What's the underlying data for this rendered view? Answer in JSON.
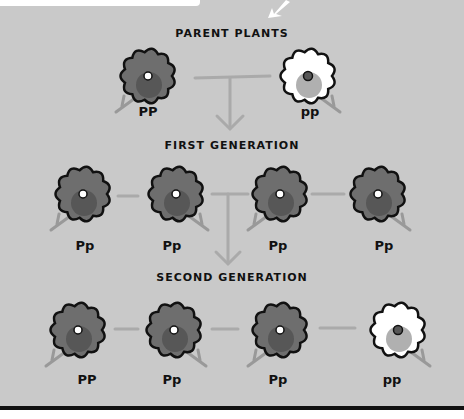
{
  "colors": {
    "background": "#c9c9c9",
    "purple_fill": "#6e6e6e",
    "purple_inner": "#575757",
    "white_fill": "#ffffff",
    "white_inner": "#b0b0b0",
    "line": "#aaaaaa",
    "outline": "#111111"
  },
  "headings": {
    "parents": "PARENT PLANTS",
    "first": "FIRST GENERATION",
    "second": "SECOND GENERATION"
  },
  "parents": [
    {
      "genotype": "PP",
      "color": "purple"
    },
    {
      "genotype": "pp",
      "color": "white"
    }
  ],
  "first_generation": [
    {
      "genotype": "Pp",
      "color": "purple"
    },
    {
      "genotype": "Pp",
      "color": "purple"
    },
    {
      "genotype": "Pp",
      "color": "purple"
    },
    {
      "genotype": "Pp",
      "color": "purple"
    }
  ],
  "second_generation": [
    {
      "genotype": "PP",
      "color": "purple"
    },
    {
      "genotype": "Pp",
      "color": "purple"
    },
    {
      "genotype": "Pp",
      "color": "purple"
    },
    {
      "genotype": "pp",
      "color": "white"
    }
  ]
}
